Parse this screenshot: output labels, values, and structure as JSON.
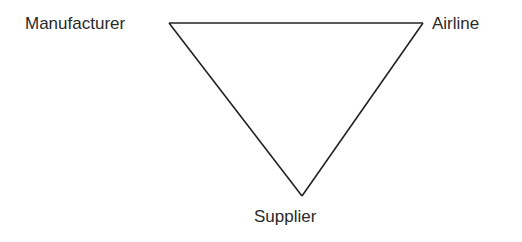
{
  "diagram": {
    "type": "triangle-relationship",
    "nodes": [
      {
        "id": "manufacturer",
        "label": "Manufacturer"
      },
      {
        "id": "airline",
        "label": "Airline"
      },
      {
        "id": "supplier",
        "label": "Supplier"
      }
    ],
    "edges": [
      {
        "from": "manufacturer",
        "to": "airline"
      },
      {
        "from": "airline",
        "to": "supplier"
      },
      {
        "from": "supplier",
        "to": "manufacturer"
      }
    ],
    "line_color": "#222222",
    "text_color": "#2a2a2a"
  }
}
